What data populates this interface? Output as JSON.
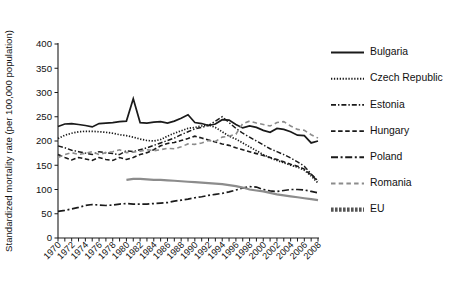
{
  "chart_data": {
    "type": "line",
    "title": "",
    "xlabel": "",
    "ylabel": "Standardized mortality rate (per 100,000 population)",
    "xlim": [
      1970,
      2008
    ],
    "ylim": [
      0,
      400
    ],
    "yticks": [
      0,
      50,
      100,
      150,
      200,
      250,
      300,
      350,
      400
    ],
    "xticks": [
      1970,
      1972,
      1974,
      1976,
      1978,
      1980,
      1982,
      1984,
      1986,
      1988,
      1990,
      1992,
      1994,
      1996,
      1998,
      2000,
      2002,
      2004,
      2006,
      2008
    ],
    "xtick_labels": [
      "1970",
      "1972",
      "1974",
      "1976",
      "1978",
      "1980",
      "1982",
      "1984",
      "1986",
      "1988",
      "1990",
      "1992",
      "1994",
      "1996",
      "1998",
      "2000",
      "2002",
      "2004",
      "2006",
      "2008"
    ],
    "x": [
      1970,
      1971,
      1972,
      1973,
      1974,
      1975,
      1976,
      1977,
      1978,
      1979,
      1980,
      1981,
      1982,
      1983,
      1984,
      1985,
      1986,
      1987,
      1988,
      1989,
      1990,
      1991,
      1992,
      1993,
      1994,
      1995,
      1996,
      1997,
      1998,
      1999,
      2000,
      2001,
      2002,
      2003,
      2004,
      2005,
      2006,
      2007,
      2008
    ],
    "grid": false,
    "legend_position": "right",
    "series": [
      {
        "name": "Bulgaria",
        "color": "#1a1a1a",
        "style": "solid",
        "dasharray": "",
        "width": 1.7,
        "values": [
          230,
          235,
          236,
          234,
          232,
          229,
          236,
          237,
          238,
          240,
          241,
          287,
          238,
          237,
          239,
          240,
          237,
          241,
          247,
          254,
          238,
          236,
          232,
          235,
          244,
          243,
          234,
          227,
          231,
          228,
          222,
          218,
          226,
          224,
          219,
          212,
          211,
          196,
          200
        ]
      },
      {
        "name": "Czech Republic",
        "color": "#1a1a1a",
        "style": "dotted",
        "dasharray": "1.3,1.6",
        "width": 1.7,
        "values": [
          205,
          212,
          216,
          219,
          220,
          220,
          219,
          218,
          216,
          213,
          211,
          208,
          204,
          201,
          200,
          203,
          210,
          216,
          221,
          226,
          228,
          231,
          233,
          228,
          219,
          210,
          204,
          196,
          188,
          180,
          172,
          165,
          160,
          155,
          150,
          146,
          140,
          128,
          113
        ]
      },
      {
        "name": "Estonia",
        "color": "#1a1a1a",
        "style": "dashdot",
        "dasharray": "5,2,1.4,2",
        "width": 1.5,
        "values": [
          190,
          186,
          181,
          178,
          175,
          172,
          178,
          176,
          174,
          172,
          180,
          178,
          182,
          186,
          191,
          196,
          201,
          206,
          213,
          219,
          225,
          228,
          232,
          241,
          250,
          238,
          226,
          216,
          208,
          200,
          192,
          184,
          178,
          172,
          165,
          157,
          148,
          132,
          118
        ]
      },
      {
        "name": "Hungary",
        "color": "#1a1a1a",
        "style": "dashed",
        "dasharray": "4.5,2.6",
        "width": 1.6,
        "values": [
          172,
          166,
          161,
          166,
          163,
          160,
          166,
          162,
          160,
          166,
          162,
          166,
          172,
          176,
          182,
          190,
          195,
          197,
          201,
          205,
          210,
          206,
          202,
          198,
          194,
          191,
          186,
          182,
          178,
          174,
          170,
          166,
          162,
          157,
          152,
          148,
          142,
          130,
          117
        ]
      },
      {
        "name": "Poland",
        "color": "#1a1a1a",
        "style": "longdashdot",
        "dasharray": "7,2.6,2,2.6",
        "width": 1.7,
        "values": [
          55,
          57,
          60,
          63,
          67,
          69,
          68,
          67,
          68,
          70,
          71,
          70,
          70,
          70,
          71,
          72,
          73,
          76,
          78,
          80,
          83,
          85,
          88,
          90,
          92,
          95,
          99,
          103,
          106,
          105,
          100,
          97,
          96,
          98,
          100,
          100,
          99,
          96,
          93
        ]
      },
      {
        "name": "Romania",
        "color": "#8c8c8c",
        "style": "dashed",
        "dasharray": "4.5,3.2",
        "width": 1.6,
        "values": [
          166,
          172,
          176,
          172,
          175,
          178,
          172,
          176,
          178,
          182,
          176,
          177,
          179,
          182,
          180,
          182,
          185,
          184,
          188,
          194,
          193,
          196,
          201,
          199,
          208,
          210,
          214,
          236,
          241,
          237,
          234,
          231,
          238,
          240,
          231,
          224,
          222,
          213,
          206
        ]
      },
      {
        "name": "EU",
        "color": "#8c8c8c",
        "style": "solid",
        "dasharray": "",
        "width": 2.2,
        "values": [
          null,
          null,
          null,
          null,
          null,
          null,
          null,
          null,
          null,
          null,
          120,
          122,
          122,
          121,
          120,
          120,
          119,
          118,
          117,
          116,
          115,
          114,
          113,
          112,
          111,
          109,
          107,
          104,
          100,
          98,
          96,
          93,
          90,
          88,
          86,
          84,
          82,
          80,
          78
        ]
      }
    ],
    "legend_entries": [
      {
        "label": "Bulgaria",
        "color": "#1a1a1a",
        "dasharray": "",
        "width": 1.9
      },
      {
        "label": "Czech Republic",
        "color": "#1a1a1a",
        "dasharray": "1.3,1.6",
        "width": 1.9
      },
      {
        "label": "Estonia",
        "color": "#1a1a1a",
        "dasharray": "5,2,1.4,2",
        "width": 1.7
      },
      {
        "label": "Hungary",
        "color": "#1a1a1a",
        "dasharray": "4.5,2.6",
        "width": 1.8
      },
      {
        "label": "Poland",
        "color": "#1a1a1a",
        "dasharray": "7,2.6,2,2.6",
        "width": 1.9
      },
      {
        "label": "Romania",
        "color": "#8c8c8c",
        "dasharray": "4.5,3.2",
        "width": 1.8
      },
      {
        "label": "EU",
        "color": "#555555",
        "dasharray": "2.6,1.4",
        "width": 4.2
      }
    ]
  }
}
